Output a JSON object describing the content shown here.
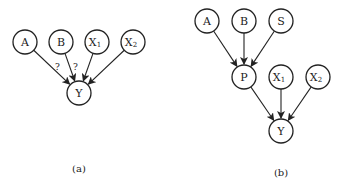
{
  "panels": [
    {
      "caption": "(a)",
      "nodes": [
        {
          "id": "A",
          "label": "A",
          "sub": "",
          "x": 25,
          "y": 42
        },
        {
          "id": "B",
          "label": "B",
          "sub": "",
          "x": 61,
          "y": 42
        },
        {
          "id": "X1",
          "label": "X",
          "sub": "1",
          "x": 97,
          "y": 42
        },
        {
          "id": "X2",
          "label": "X",
          "sub": "2",
          "x": 133,
          "y": 42
        },
        {
          "id": "Y",
          "label": "Y",
          "sub": "",
          "x": 79,
          "y": 93
        }
      ],
      "edges": [
        {
          "from": "A",
          "to": "Y",
          "label": "?"
        },
        {
          "from": "B",
          "to": "Y",
          "label": "?"
        },
        {
          "from": "X1",
          "to": "Y",
          "label": ""
        },
        {
          "from": "X2",
          "to": "Y",
          "label": ""
        }
      ]
    },
    {
      "caption": "(b)",
      "nodes": [
        {
          "id": "A",
          "label": "A",
          "sub": "",
          "x": 207,
          "y": 21
        },
        {
          "id": "B",
          "label": "B",
          "sub": "",
          "x": 244,
          "y": 21
        },
        {
          "id": "S",
          "label": "S",
          "sub": "",
          "x": 281,
          "y": 21
        },
        {
          "id": "P",
          "label": "P",
          "sub": "",
          "x": 244,
          "y": 77
        },
        {
          "id": "X1",
          "label": "X",
          "sub": "1",
          "x": 281,
          "y": 77
        },
        {
          "id": "X2",
          "label": "X",
          "sub": "2",
          "x": 318,
          "y": 77
        },
        {
          "id": "Y",
          "label": "Y",
          "sub": "",
          "x": 281,
          "y": 131
        }
      ],
      "edges": [
        {
          "from": "A",
          "to": "P",
          "label": ""
        },
        {
          "from": "B",
          "to": "P",
          "label": ""
        },
        {
          "from": "S",
          "to": "P",
          "label": ""
        },
        {
          "from": "P",
          "to": "Y",
          "label": ""
        },
        {
          "from": "X1",
          "to": "Y",
          "label": ""
        },
        {
          "from": "X2",
          "to": "Y",
          "label": ""
        }
      ]
    }
  ],
  "style": {
    "stroke": "#222222",
    "background": "#ffffff",
    "node_radius": 12
  }
}
